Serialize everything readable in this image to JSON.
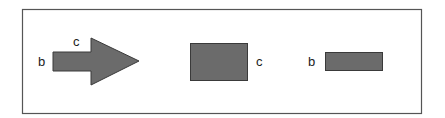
{
  "diagram": {
    "frame": {
      "x": 22,
      "y": 9,
      "w": 399,
      "h": 104,
      "stroke": "#555555"
    },
    "fill_color": "#6b6b6b",
    "stroke_color": "#333333",
    "shapes": [
      {
        "id": "arrow",
        "type": "arrow",
        "label_side": "b",
        "label_top": "c"
      },
      {
        "id": "square",
        "type": "rectangle",
        "label_right": "c"
      },
      {
        "id": "bar",
        "type": "rectangle",
        "label_left": "b"
      }
    ],
    "labels": {
      "arrow_left": "b",
      "arrow_top": "c",
      "square_right": "c",
      "bar_left": "b"
    }
  }
}
